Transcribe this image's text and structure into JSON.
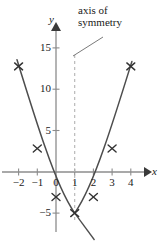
{
  "annotations": {
    "axis_of_symmetry": {
      "line1": "axis of",
      "line2": "symmetry"
    }
  },
  "axis_letters": {
    "x": "x",
    "y": "y"
  },
  "colors": {
    "curve": "#4d4d4d",
    "axis": "#8c8c8c",
    "dashed": "#b3b3b3",
    "text": "#1a1a1a",
    "background": "#ffffff"
  },
  "chart_data": {
    "type": "scatter",
    "title": "",
    "xlabel": "x",
    "ylabel": "y",
    "grid": false,
    "legend": null,
    "xlim": [
      -2.6,
      4.8
    ],
    "ylim": [
      -7.5,
      17
    ],
    "xticks": [
      -2,
      -1,
      0,
      1,
      2,
      3,
      4
    ],
    "xtick_labels": [
      "−2",
      "−1",
      "0",
      "1",
      "2",
      "3",
      "4"
    ],
    "yticks": [
      5,
      10,
      15,
      -5
    ],
    "ytick_labels": [
      "5",
      "10",
      "15",
      "−5"
    ],
    "series": [
      {
        "name": "plotted points",
        "marker": "x",
        "x": [
          -2,
          -1,
          0,
          1,
          2,
          3,
          4
        ],
        "values": [
          13,
          3,
          -3,
          -5,
          -3,
          3,
          13
        ]
      }
    ],
    "curve": {
      "name": "parabola",
      "equation": "y = 2(x − 1)² − 5",
      "vertex": [
        1,
        -5
      ],
      "x_start": -2.1,
      "x_end": 4.15
    },
    "axis_of_symmetry": {
      "x": 1,
      "style": "dashed",
      "label": "axis of symmetry"
    },
    "tangent_line": {
      "from": [
        1,
        -5
      ],
      "to": [
        2.05,
        -8.2
      ]
    },
    "annotations": [
      {
        "text": "axis of symmetry",
        "points_to_x": 1
      }
    ]
  }
}
